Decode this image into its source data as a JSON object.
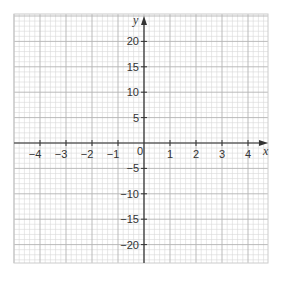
{
  "chart_data": {
    "type": "line",
    "title": "",
    "xlabel": "x",
    "ylabel": "y",
    "xlim": [
      -5,
      5
    ],
    "ylim": [
      -25,
      25
    ],
    "x_ticks": [
      -4,
      -3,
      -2,
      -1,
      1,
      2,
      3,
      4
    ],
    "y_ticks": [
      20,
      15,
      10,
      5,
      -5,
      -10,
      -15,
      -20
    ],
    "origin_label": "0",
    "grid": true,
    "grid_minor_subdivisions": 5,
    "series": []
  },
  "axes": {
    "x_label": "x",
    "y_label": "y",
    "origin": "0",
    "x_tick_labels": [
      "−4",
      "−3",
      "−2",
      "−1",
      "1",
      "2",
      "3",
      "4"
    ],
    "y_tick_labels": [
      "20",
      "15",
      "10",
      "5",
      "−5",
      "−10",
      "−15",
      "−20"
    ]
  },
  "colors": {
    "grid_minor": "#d9d9d9",
    "grid_major": "#b3b3b3",
    "axis": "#333333",
    "background": "#ffffff"
  }
}
